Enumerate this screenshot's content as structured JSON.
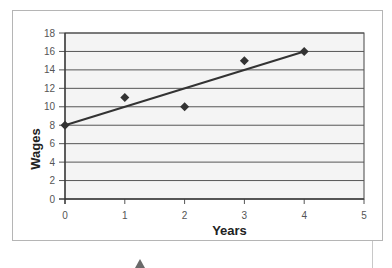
{
  "chart_data": {
    "type": "scatter",
    "title": "",
    "xlabel": "Years",
    "ylabel": "Wages",
    "x": [
      0,
      1,
      2,
      3,
      4
    ],
    "series": [
      {
        "name": "Wages",
        "values": [
          8,
          11,
          10,
          15,
          16
        ],
        "marker": "diamond",
        "color": "#333333"
      }
    ],
    "trendline": {
      "x": [
        0,
        4
      ],
      "y": [
        8,
        16
      ],
      "color": "#333333"
    },
    "xlim": [
      0,
      5
    ],
    "ylim": [
      0,
      18
    ],
    "xticks": [
      "0",
      "1",
      "2",
      "3",
      "4",
      "5"
    ],
    "yticks": [
      "0",
      "2",
      "4",
      "6",
      "8",
      "10",
      "12",
      "14",
      "16",
      "18"
    ],
    "grid": {
      "horizontal": true,
      "vertical": false
    },
    "legend": null,
    "plot_background": "#f4f4f4"
  }
}
